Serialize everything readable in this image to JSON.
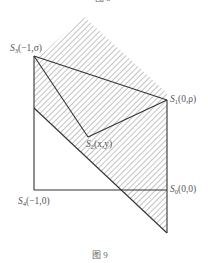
{
  "figure": {
    "top_caption_partial": "图 8",
    "caption": "图 9",
    "points": {
      "S3": {
        "name": "S",
        "sub": "3",
        "coords": "(−1,σ)"
      },
      "S1": {
        "name": "S",
        "sub": "1",
        "coords": "(0,ρ)"
      },
      "S2": {
        "name": "S",
        "sub": "2",
        "coords": "(x,y)"
      },
      "S4": {
        "name": "S",
        "sub": "4",
        "coords": "(−1,0)"
      },
      "S0": {
        "name": "S",
        "sub": "0",
        "coords": "(0,0)"
      }
    },
    "colors": {
      "line": "#333333",
      "hatch": "#777777",
      "text": "#555555"
    }
  }
}
